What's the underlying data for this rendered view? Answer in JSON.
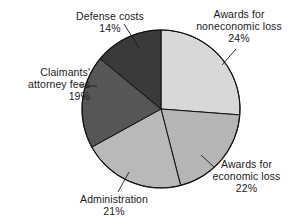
{
  "chart_data": {
    "type": "pie",
    "title": "",
    "subtitle": "",
    "xlabel": "",
    "ylabel": "",
    "legend_position": "none",
    "grid": false,
    "labels_outside": true,
    "value_unit": "percent",
    "start_angle_deg": 0,
    "direction": "clockwise",
    "categories": [
      "Awards for noneconomic loss",
      "Awards for economic loss",
      "Administration",
      "Claimants' attorney fees",
      "Defense costs"
    ],
    "values": [
      24,
      22,
      21,
      19,
      14
    ],
    "slice_colors": [
      "#d8d8d8",
      "#b5b5b5",
      "#b9b9b9",
      "#565656",
      "#3a3a3a"
    ],
    "slices": [
      {
        "name": "Awards for noneconomic loss",
        "value": 24,
        "value_label": "24%",
        "color": "#d8d8d8",
        "start_deg": 0,
        "end_deg": 86.4
      },
      {
        "name": "Awards for economic loss",
        "value": 22,
        "value_label": "22%",
        "color": "#b5b5b5",
        "start_deg": 86.4,
        "end_deg": 165.6
      },
      {
        "name": "Administration",
        "value": 21,
        "value_label": "21%",
        "color": "#b9b9b9",
        "start_deg": 165.6,
        "end_deg": 241.2
      },
      {
        "name": "Claimants' attorney fees",
        "value": 19,
        "value_label": "19%",
        "color": "#565656",
        "start_deg": 241.2,
        "end_deg": 309.6
      },
      {
        "name": "Defense costs",
        "value": 14,
        "value_label": "14%",
        "color": "#3a3a3a",
        "start_deg": 309.6,
        "end_deg": 360
      }
    ],
    "geometry": {
      "center_x": 161,
      "center_y": 109,
      "radius": 79,
      "outline_color": "#111111"
    }
  },
  "labels": {
    "defense": {
      "line1": "Defense costs",
      "value": "14%"
    },
    "noneconomic": {
      "line1": "Awards for",
      "line2": "noneconomic loss",
      "value": "24%"
    },
    "attorney": {
      "line1": "Claimants'",
      "line2": "attorney fees",
      "value": "19%"
    },
    "administration": {
      "line1": "Administration",
      "value": "21%"
    },
    "economic": {
      "line1": "Awards for",
      "line2": "economic loss",
      "value": "22%"
    }
  }
}
